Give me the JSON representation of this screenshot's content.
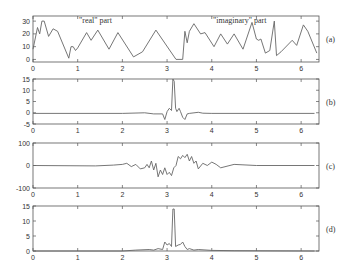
{
  "chart_data": [
    {
      "id": "a",
      "type": "line",
      "panel_label": "(a)",
      "annotations": [
        "\"real\" part",
        "\"imaginary\" part"
      ],
      "xlim": [
        0,
        6.4
      ],
      "ylim": [
        -2,
        34
      ],
      "xticks": [
        0,
        1,
        2,
        3,
        4,
        5,
        6
      ],
      "yticks": [
        0,
        10,
        20,
        30
      ],
      "x": [
        0,
        0.1,
        0.15,
        0.2,
        0.25,
        0.35,
        0.45,
        0.55,
        0.8,
        0.85,
        0.9,
        0.95,
        1.0,
        1.2,
        1.3,
        1.45,
        1.7,
        1.9,
        2.25,
        2.45,
        2.75,
        3.2,
        3.35,
        3.4,
        3.45,
        3.5,
        3.6,
        3.75,
        3.85,
        4.05,
        4.2,
        4.35,
        4.5,
        4.7,
        4.9,
        5.0,
        5.05,
        5.1,
        5.2,
        5.3,
        5.4,
        5.45,
        5.55,
        5.8,
        5.9,
        6.05,
        6.15,
        6.35
      ],
      "y": [
        8,
        25,
        20,
        30,
        30,
        18,
        24,
        22,
        1,
        10,
        10,
        7,
        9,
        21,
        15,
        23,
        8,
        21,
        2,
        6,
        23,
        0,
        0,
        22,
        13,
        22,
        28,
        20,
        21,
        10,
        20,
        12,
        20,
        8,
        29,
        16,
        15,
        16,
        5,
        7,
        30,
        3,
        6,
        15,
        11,
        27,
        22,
        5
      ]
    },
    {
      "id": "b",
      "type": "line",
      "panel_label": "(b)",
      "xlim": [
        0,
        6.4
      ],
      "ylim": [
        -5,
        15
      ],
      "xticks": [
        0,
        1,
        2,
        3,
        4,
        5,
        6
      ],
      "yticks": [
        -5,
        0,
        5,
        10,
        15
      ],
      "x": [
        0,
        2.0,
        2.5,
        2.7,
        2.9,
        2.95,
        3.0,
        3.05,
        3.1,
        3.13,
        3.16,
        3.19,
        3.22,
        3.27,
        3.3,
        3.35,
        3.4,
        3.45,
        3.5,
        3.7,
        3.8,
        4.0,
        6.3
      ],
      "y": [
        -0.3,
        -0.3,
        0,
        -0.5,
        -0.5,
        -3,
        0.5,
        2,
        1,
        15,
        14,
        2,
        0.5,
        2,
        0.5,
        -2,
        -3,
        -0.5,
        -0.3,
        0.2,
        -0.2,
        -0.3,
        -0.3
      ]
    },
    {
      "id": "c",
      "type": "line",
      "panel_label": "(c)",
      "xlim": [
        0,
        6.4
      ],
      "ylim": [
        -100,
        100
      ],
      "xticks": [
        0,
        1,
        2,
        3,
        4,
        5,
        6
      ],
      "yticks": [
        -100,
        0,
        100
      ],
      "x": [
        0,
        1.4,
        1.8,
        2.0,
        2.1,
        2.2,
        2.3,
        2.4,
        2.5,
        2.55,
        2.6,
        2.65,
        2.7,
        2.75,
        2.8,
        2.85,
        2.9,
        2.95,
        3.0,
        3.05,
        3.1,
        3.15,
        3.2,
        3.25,
        3.3,
        3.35,
        3.4,
        3.45,
        3.5,
        3.55,
        3.6,
        3.65,
        3.7,
        3.8,
        3.9,
        4.0,
        4.1,
        4.2,
        4.5,
        5.0,
        6.3
      ],
      "y": [
        0,
        -2,
        2,
        5,
        10,
        -5,
        5,
        -15,
        -10,
        5,
        -10,
        20,
        -20,
        10,
        -50,
        -20,
        -40,
        -10,
        -40,
        -30,
        -45,
        -10,
        0,
        40,
        30,
        45,
        35,
        50,
        20,
        40,
        10,
        20,
        -15,
        10,
        0,
        15,
        5,
        -10,
        5,
        0,
        0
      ]
    },
    {
      "id": "d",
      "type": "line",
      "panel_label": "(d)",
      "xlim": [
        0,
        6.4
      ],
      "ylim": [
        0,
        15
      ],
      "xticks": [
        0,
        1,
        2,
        3,
        4,
        5,
        6
      ],
      "yticks": [
        0,
        5,
        10,
        15
      ],
      "x": [
        0,
        2.0,
        2.3,
        2.6,
        2.7,
        2.8,
        2.9,
        2.95,
        3.0,
        3.05,
        3.1,
        3.13,
        3.16,
        3.19,
        3.25,
        3.3,
        3.35,
        3.4,
        3.45,
        3.5,
        3.6,
        3.7,
        4.0,
        4.5,
        6.3
      ],
      "y": [
        0,
        0,
        0.3,
        0.5,
        0.3,
        0.8,
        0.5,
        3,
        2,
        2.5,
        1.5,
        14,
        14,
        1.5,
        2,
        2.2,
        3,
        1.5,
        0.5,
        0.8,
        0.3,
        0.5,
        0.2,
        0.1,
        0
      ]
    }
  ]
}
